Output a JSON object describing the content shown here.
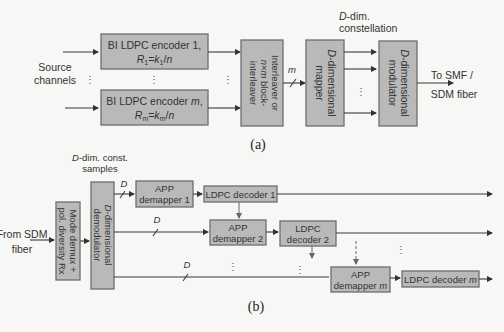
{
  "panel_a": {
    "caption": "(a)",
    "input_label": [
      "Source",
      "channels"
    ],
    "encoder_1": {
      "line1": "BI LDPC encoder 1,",
      "rate": "R1=k1/n"
    },
    "encoder_m": {
      "line1": "BI LDPC encoder m,",
      "rate": "Rm=km/n"
    },
    "interleaver": [
      "Interleaver or",
      "n×m block-",
      "interleaver"
    ],
    "bus_label": "m",
    "mapper": [
      "D-dimensional",
      "mapper"
    ],
    "constellation_label": [
      "D-dim.",
      "constellation"
    ],
    "modulator": [
      "D-dimensional",
      "modulator"
    ],
    "output_label": [
      "To SMF /",
      "SDM fiber"
    ]
  },
  "panel_b": {
    "caption": "(b)",
    "input_label": [
      "From SDM",
      "fiber"
    ],
    "demux": [
      "Mode demux +",
      "pol. diversity Rx"
    ],
    "demodulator": [
      "D-dimensional",
      "demodulator"
    ],
    "samples_label": [
      "D-dim. const.",
      "samples"
    ],
    "bus_label": "D",
    "app_demapper_1": [
      "APP",
      "demapper 1"
    ],
    "ldpc_decoder_1": "LDPC decoder 1",
    "app_demapper_2": [
      "APP",
      "demapper 2"
    ],
    "ldpc_decoder_2": [
      "LDPC",
      "decoder 2"
    ],
    "app_demapper_m": [
      "APP",
      "demapper m"
    ],
    "ldpc_decoder_m": "LDPC decoder m"
  },
  "colors": {
    "box_fill": "#b9b9b9",
    "box_stroke": "#6e6e6e",
    "line": "#3a3a3a",
    "background": "#f7f7f5"
  }
}
